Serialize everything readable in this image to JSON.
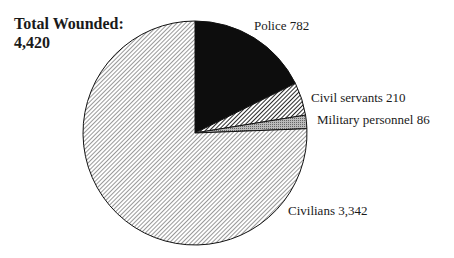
{
  "title": {
    "line1": "Total Wounded:",
    "line2": "4,420"
  },
  "labels": {
    "police": "Police 782",
    "civil": "Civil servants 210",
    "military": "Military personnel 86",
    "civilians": "Civilians 3,342"
  },
  "chart_data": {
    "type": "pie",
    "title": "Total Wounded: 4,420",
    "categories": [
      "Police",
      "Civil servants",
      "Military personnel",
      "Civilians"
    ],
    "values": [
      782,
      210,
      86,
      3342
    ],
    "total": 4420,
    "start_angle": "12 o'clock, clockwise",
    "fills": [
      "solid black",
      "dense diagonal hatch",
      "gray crosshatch",
      "light diagonal hatch"
    ],
    "legend": "none (direct labels)"
  }
}
